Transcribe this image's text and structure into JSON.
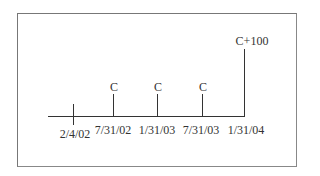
{
  "diagram": {
    "type": "cash-flow timeline",
    "start": {
      "date": "2/4/02"
    },
    "payments": [
      {
        "date": "7/31/02",
        "amount": "C"
      },
      {
        "date": "1/31/03",
        "amount": "C"
      },
      {
        "date": "7/31/03",
        "amount": "C"
      },
      {
        "date": "1/31/04",
        "amount": "C+100"
      }
    ]
  }
}
